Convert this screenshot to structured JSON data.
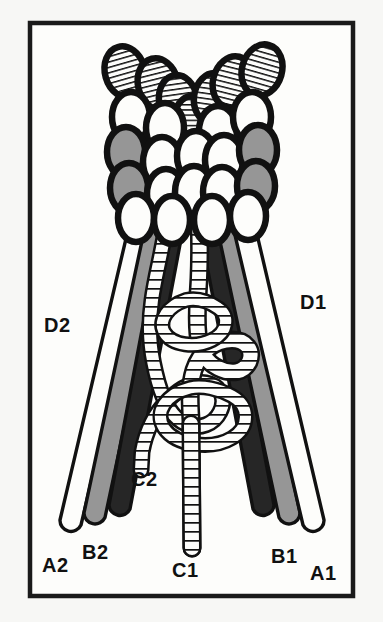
{
  "figure": {
    "frame": {
      "border_color": "#1a1a1a",
      "background_color": "#fdfdfb",
      "outer_background_color": "#f7f7f5"
    },
    "palette": {
      "outline": "#111111",
      "white_fill": "#fdfdfb",
      "gray_fill": "#969696",
      "dark_fill": "#262626",
      "hatch_line": "#111111"
    },
    "labels": [
      {
        "id": "D2",
        "text": "D2",
        "x": 44,
        "y": 332,
        "anchor": "start"
      },
      {
        "id": "D1",
        "text": "D1",
        "x": 300,
        "y": 309,
        "anchor": "start"
      },
      {
        "id": "A2",
        "text": "A2",
        "x": 42,
        "y": 572,
        "anchor": "start"
      },
      {
        "id": "B2",
        "text": "B2",
        "x": 82,
        "y": 559,
        "anchor": "start"
      },
      {
        "id": "C2",
        "text": "C2",
        "x": 131,
        "y": 486,
        "anchor": "start"
      },
      {
        "id": "C1",
        "text": "C1",
        "x": 172,
        "y": 577,
        "anchor": "start"
      },
      {
        "id": "B1",
        "text": "B1",
        "x": 271,
        "y": 563,
        "anchor": "start"
      },
      {
        "id": "A1",
        "text": "A1",
        "x": 310,
        "y": 580,
        "anchor": "start"
      }
    ],
    "strands": {
      "left": [
        {
          "name": "A2",
          "fill": "white_fill"
        },
        {
          "name": "B2",
          "fill": "gray_fill"
        },
        {
          "name": "D2-inner",
          "fill": "dark_fill"
        }
      ],
      "right": [
        {
          "name": "D1-inner",
          "fill": "dark_fill"
        },
        {
          "name": "B1",
          "fill": "gray_fill"
        },
        {
          "name": "A1",
          "fill": "white_fill"
        }
      ],
      "center": [
        {
          "name": "C1",
          "fill": "hatched"
        },
        {
          "name": "C2",
          "fill": "hatched"
        }
      ]
    },
    "ellipse_cluster": {
      "description": "V-shaped cluster of outlined ellipses; top row hatched, middle rows white, outer columns gray",
      "fills": [
        "hatched",
        "white",
        "gray"
      ]
    }
  }
}
